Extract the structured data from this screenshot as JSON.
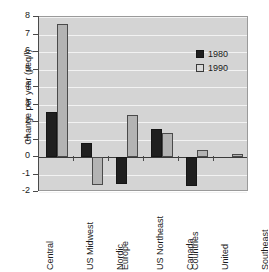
{
  "chart_data": {
    "type": "bar",
    "title": "",
    "xlabel": "",
    "ylabel": "Change per year (µeq/l)",
    "ylim": [
      -2,
      8
    ],
    "yticks": [
      8,
      7,
      6,
      5,
      4,
      3,
      2,
      1,
      0,
      -1,
      -2
    ],
    "ytick_labels": [
      "8",
      "7",
      "6",
      "5",
      "4",
      "3",
      "2",
      "1",
      "0",
      "-1",
      "-2"
    ],
    "grid": true,
    "legend_position": "upper right",
    "categories": [
      "Central Europe",
      "US Midwest",
      "Nordic Countries",
      "US Northeast",
      "Canada Southeast",
      "United Kingdom"
    ],
    "category_label_lines": [
      [
        "Central",
        "Europe"
      ],
      [
        "US Midwest"
      ],
      [
        "Nordic",
        "Countries"
      ],
      [
        "US Northeast"
      ],
      [
        "Canada",
        "Southeast"
      ],
      [
        "United",
        "Kingdom"
      ]
    ],
    "series": [
      {
        "name": "1980",
        "color": "#1f1f1f",
        "values": [
          2.6,
          0.8,
          -1.55,
          1.6,
          -1.65,
          0.0
        ]
      },
      {
        "name": "1990",
        "color": "#b3b3b3",
        "values": [
          7.6,
          -1.6,
          2.4,
          1.4,
          0.4,
          0.2
        ]
      }
    ]
  },
  "legend": {
    "items": [
      {
        "label": "1980"
      },
      {
        "label": "1990"
      }
    ]
  },
  "colors": {
    "series_1980": "#1f1f1f",
    "series_1990": "#b3b3b3",
    "plot_background": "#d4d4d4",
    "gridline": "#f2f2f2",
    "axis": "#4a4a4a"
  }
}
